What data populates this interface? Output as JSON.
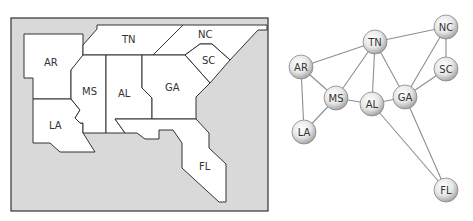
{
  "map": {
    "title": "Southeastern US states map",
    "background_color": "#d9d9d9",
    "land_color": "#ffffff",
    "states": [
      {
        "id": "AR",
        "label": "AR"
      },
      {
        "id": "TN",
        "label": "TN"
      },
      {
        "id": "NC",
        "label": "NC"
      },
      {
        "id": "SC",
        "label": "SC"
      },
      {
        "id": "MS",
        "label": "MS"
      },
      {
        "id": "AL",
        "label": "AL"
      },
      {
        "id": "GA",
        "label": "GA"
      },
      {
        "id": "LA",
        "label": "LA"
      },
      {
        "id": "FL",
        "label": "FL"
      }
    ]
  },
  "graph": {
    "title": "Adjacency graph of states",
    "nodes": [
      {
        "id": "TN",
        "label": "TN"
      },
      {
        "id": "NC",
        "label": "NC"
      },
      {
        "id": "AR",
        "label": "AR"
      },
      {
        "id": "SC",
        "label": "SC"
      },
      {
        "id": "MS",
        "label": "MS"
      },
      {
        "id": "AL",
        "label": "AL"
      },
      {
        "id": "GA",
        "label": "GA"
      },
      {
        "id": "LA",
        "label": "LA"
      },
      {
        "id": "FL",
        "label": "FL"
      }
    ],
    "edges": [
      [
        "AR",
        "TN"
      ],
      [
        "AR",
        "MS"
      ],
      [
        "AR",
        "LA"
      ],
      [
        "TN",
        "NC"
      ],
      [
        "TN",
        "MS"
      ],
      [
        "TN",
        "AL"
      ],
      [
        "TN",
        "GA"
      ],
      [
        "NC",
        "SC"
      ],
      [
        "NC",
        "GA"
      ],
      [
        "SC",
        "GA"
      ],
      [
        "MS",
        "AL"
      ],
      [
        "MS",
        "LA"
      ],
      [
        "AL",
        "GA"
      ],
      [
        "AL",
        "FL"
      ],
      [
        "GA",
        "FL"
      ]
    ]
  }
}
